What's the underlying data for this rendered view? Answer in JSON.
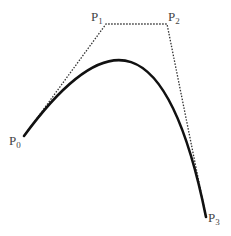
{
  "diagram": {
    "type": "cubic-bezier-curve",
    "colors": {
      "curve": "#111111",
      "control_polygon": "#333333",
      "labels": "#444444",
      "background": "#ffffff"
    },
    "points": [
      {
        "name": "P0",
        "letter": "P",
        "index": "0",
        "x": 24,
        "y": 136
      },
      {
        "name": "P1",
        "letter": "P",
        "index": "1",
        "x": 106,
        "y": 24
      },
      {
        "name": "P2",
        "letter": "P",
        "index": "2",
        "x": 167,
        "y": 24
      },
      {
        "name": "P3",
        "letter": "P",
        "index": "3",
        "x": 206,
        "y": 217
      }
    ],
    "control_polygon_style": "dotted",
    "curve_style": "solid-thick"
  }
}
